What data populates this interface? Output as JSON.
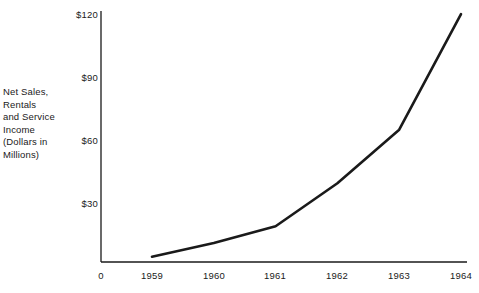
{
  "chart_data": {
    "type": "line",
    "title": "",
    "subtitle": "",
    "xlabel": "",
    "ylabel": "Net Sales,\nRentals\nand Service\nIncome\n(Dollars in\nMillions)",
    "categories": [
      "1959",
      "1960",
      "1961",
      "1962",
      "1963",
      "1964"
    ],
    "x": [
      1959,
      1960,
      1961,
      1962,
      1963,
      1964
    ],
    "values": [
      2.5,
      9,
      17,
      37.5,
      63,
      118
    ],
    "series": [
      {
        "name": "Net Sales, Rentals and Service Income",
        "values": [
          2.5,
          9,
          17,
          37.5,
          63,
          118
        ]
      }
    ],
    "ylim": [
      0,
      120
    ],
    "xlim": [
      1958.0,
      1964.0
    ],
    "ytick_values": [
      30,
      60,
      90,
      120
    ],
    "ytick_labels": [
      "$30",
      "$60",
      "$90",
      "$120"
    ],
    "xtick_labels": [
      "0",
      "1959",
      "1960",
      "1961",
      "1962",
      "1963",
      "1964"
    ],
    "grid": false,
    "legend": false,
    "legend_position": "none",
    "line_color": "#1a1a1a",
    "line_width": 2.6,
    "axis_color": "#1a1a1a",
    "background_color": "#ffffff",
    "annotations": []
  },
  "axis": {
    "caption": "Net Sales,\nRentals\nand Service\nIncome\n(Dollars in\nMillions)",
    "y_ticks": [
      {
        "label": "$120",
        "value": 120
      },
      {
        "label": "$90",
        "value": 90
      },
      {
        "label": "$60",
        "value": 60
      },
      {
        "label": "$30",
        "value": 30
      }
    ],
    "x_ticks": [
      {
        "label": "0"
      },
      {
        "label": "1959"
      },
      {
        "label": "1960"
      },
      {
        "label": "1961"
      },
      {
        "label": "1962"
      },
      {
        "label": "1963"
      },
      {
        "label": "1964"
      }
    ]
  }
}
